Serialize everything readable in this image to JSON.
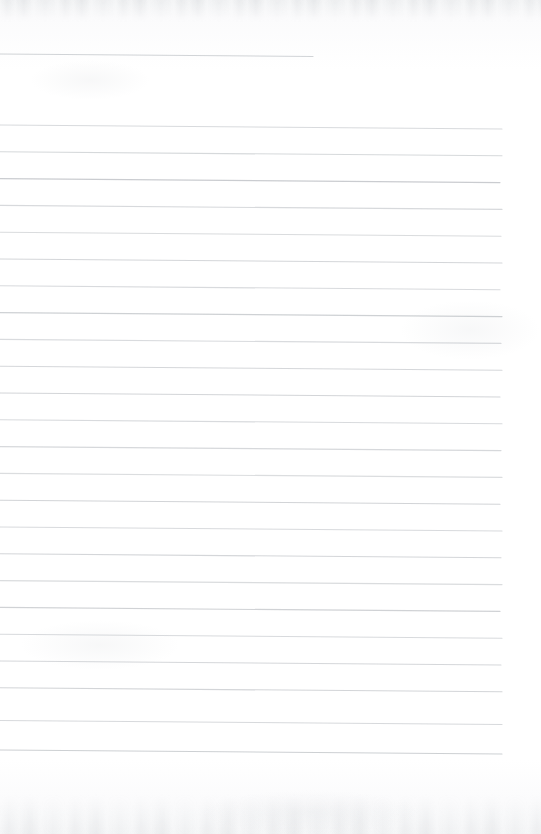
{
  "document": {
    "kind": "scanned-ruled-paper",
    "title": "Blank lined notebook page",
    "page_width": 541,
    "page_height": 834,
    "background_color": "#fdfdfd",
    "rule_color": "#b5b9be",
    "rule_thickness": 1.1,
    "text_content": "",
    "handwriting_present": "none"
  },
  "margins": {
    "left_margin_x": 0,
    "right_text_edge_x": 502,
    "top_blank_height": 54,
    "bottom_blank_height": 81
  },
  "ruling": {
    "line_spacing": 26.8,
    "slope_drop_px": 4,
    "first_body_line_y": 125,
    "last_body_line_y": 753,
    "body_line_count": 24,
    "header_rule": {
      "y": 54,
      "x_start": 0,
      "x_end": 313,
      "note": "isolated short rule near top of page"
    }
  },
  "lines": [
    {
      "id": "rule-header",
      "y": 54,
      "x_start": 0,
      "x_end": 313,
      "opacity": 0.62
    },
    {
      "id": "rule-01",
      "y": 125.0,
      "x_start": 0,
      "x_end": 502,
      "opacity": 0.52
    },
    {
      "id": "rule-02",
      "y": 151.8,
      "x_start": 0,
      "x_end": 502,
      "opacity": 0.55
    },
    {
      "id": "rule-03",
      "y": 178.6,
      "x_start": 0,
      "x_end": 500,
      "opacity": 0.72
    },
    {
      "id": "rule-04",
      "y": 205.4,
      "x_start": 0,
      "x_end": 502,
      "opacity": 0.54
    },
    {
      "id": "rule-05",
      "y": 232.2,
      "x_start": 0,
      "x_end": 501,
      "opacity": 0.5
    },
    {
      "id": "rule-06",
      "y": 259.0,
      "x_start": 0,
      "x_end": 502,
      "opacity": 0.58
    },
    {
      "id": "rule-07",
      "y": 285.8,
      "x_start": 0,
      "x_end": 500,
      "opacity": 0.53
    },
    {
      "id": "rule-08",
      "y": 312.6,
      "x_start": 0,
      "x_end": 502,
      "opacity": 0.66
    },
    {
      "id": "rule-09",
      "y": 339.4,
      "x_start": 0,
      "x_end": 501,
      "opacity": 0.51
    },
    {
      "id": "rule-10",
      "y": 366.2,
      "x_start": 0,
      "x_end": 502,
      "opacity": 0.57
    },
    {
      "id": "rule-11",
      "y": 393.0,
      "x_start": 0,
      "x_end": 500,
      "opacity": 0.6
    },
    {
      "id": "rule-12",
      "y": 419.8,
      "x_start": 0,
      "x_end": 502,
      "opacity": 0.52
    },
    {
      "id": "rule-13",
      "y": 446.6,
      "x_start": 0,
      "x_end": 501,
      "opacity": 0.56
    },
    {
      "id": "rule-14",
      "y": 473.4,
      "x_start": 0,
      "x_end": 502,
      "opacity": 0.49
    },
    {
      "id": "rule-15",
      "y": 500.2,
      "x_start": 0,
      "x_end": 500,
      "opacity": 0.61
    },
    {
      "id": "rule-16",
      "y": 527.0,
      "x_start": 0,
      "x_end": 502,
      "opacity": 0.53
    },
    {
      "id": "rule-17",
      "y": 553.8,
      "x_start": 0,
      "x_end": 501,
      "opacity": 0.58
    },
    {
      "id": "rule-18",
      "y": 580.6,
      "x_start": 0,
      "x_end": 502,
      "opacity": 0.5
    },
    {
      "id": "rule-19",
      "y": 607.4,
      "x_start": 0,
      "x_end": 500,
      "opacity": 0.64
    },
    {
      "id": "rule-20",
      "y": 634.2,
      "x_start": 0,
      "x_end": 502,
      "opacity": 0.52
    },
    {
      "id": "rule-21",
      "y": 661.0,
      "x_start": 0,
      "x_end": 501,
      "opacity": 0.57
    },
    {
      "id": "rule-22",
      "y": 687.8,
      "x_start": 0,
      "x_end": 502,
      "opacity": 0.6
    },
    {
      "id": "rule-23",
      "y": 720.5,
      "x_start": 0,
      "x_end": 502,
      "opacity": 0.54
    },
    {
      "id": "rule-24",
      "y": 750.0,
      "x_start": 0,
      "x_end": 502,
      "opacity": 0.68
    }
  ],
  "smudges": [
    {
      "id": "smudge-upper-left",
      "x": 30,
      "y": 60,
      "w": 120,
      "h": 40
    },
    {
      "id": "smudge-mid-right",
      "x": 400,
      "y": 300,
      "w": 140,
      "h": 60
    },
    {
      "id": "smudge-lower-left",
      "x": 20,
      "y": 620,
      "w": 160,
      "h": 50
    },
    {
      "id": "smudge-bottom-mid",
      "x": 200,
      "y": 790,
      "w": 220,
      "h": 44
    }
  ]
}
